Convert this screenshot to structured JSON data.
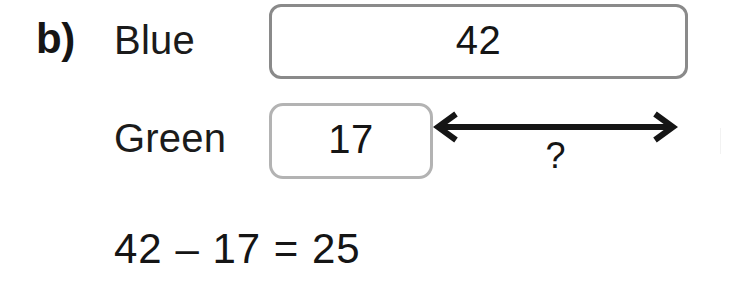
{
  "page": {
    "part_label": "b)",
    "background_color": "#ffffff",
    "text_color": "#151515"
  },
  "bar_model": {
    "rows": [
      {
        "name": "blue",
        "label": "Blue",
        "value": "42",
        "border_color": "#8a8a8a"
      },
      {
        "name": "green",
        "label": "Green",
        "value": "17",
        "border_color": "#b3b3b3"
      }
    ],
    "difference_arrow": {
      "icon": "double-headed-arrow-icon",
      "label": "?",
      "color": "#151515"
    }
  },
  "equation": {
    "text": "42 – 17 = 25",
    "minuend": "42",
    "operator": "–",
    "subtrahend": "17",
    "equals": "=",
    "result": "25"
  }
}
